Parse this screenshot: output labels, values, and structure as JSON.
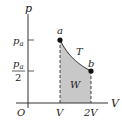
{
  "diagram": {
    "type": "pV-diagram",
    "process": "isothermal expansion",
    "axes": {
      "y_label": "p",
      "x_label": "V",
      "origin_label": "O"
    },
    "y_ticks": [
      {
        "label_num": "p",
        "label_sub": "a",
        "value": "p_a"
      },
      {
        "label_num": "p",
        "label_sub": "a",
        "label_den": "2",
        "value": "p_a/2"
      }
    ],
    "x_ticks": [
      {
        "label": "V"
      },
      {
        "label": "2V"
      }
    ],
    "points": [
      {
        "label": "a",
        "V": 1,
        "p": 1
      },
      {
        "label": "b",
        "V": 2,
        "p": 0.5
      }
    ],
    "curve_label": "T",
    "area_label": "W",
    "colors": {
      "shade": "#c8c8c8",
      "line": "#222222"
    }
  }
}
